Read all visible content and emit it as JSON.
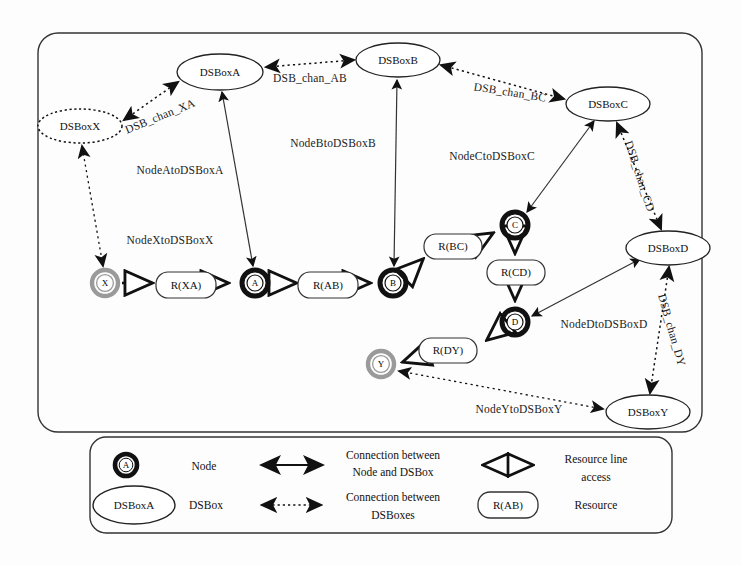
{
  "diagram": {
    "frame": {
      "name": "main-frame"
    },
    "nodes": [
      {
        "id": "X",
        "label": "X",
        "x": 105,
        "y": 283,
        "style": "gray"
      },
      {
        "id": "A",
        "label": "A",
        "x": 255,
        "y": 283,
        "style": "black"
      },
      {
        "id": "B",
        "label": "B",
        "x": 393,
        "y": 283,
        "style": "black"
      },
      {
        "id": "C",
        "label": "C",
        "x": 515,
        "y": 225,
        "style": "black"
      },
      {
        "id": "D",
        "label": "D",
        "x": 515,
        "y": 322,
        "style": "black"
      },
      {
        "id": "Y",
        "label": "Y",
        "x": 381,
        "y": 364,
        "style": "gray"
      }
    ],
    "resources": [
      {
        "id": "RXA",
        "label": "R(XA)",
        "x": 185,
        "y": 285
      },
      {
        "id": "RAB",
        "label": "R(AB)",
        "x": 328,
        "y": 285
      },
      {
        "id": "RBC",
        "label": "R(BC)",
        "x": 452,
        "y": 246
      },
      {
        "id": "RCD",
        "label": "R(CD)",
        "x": 515,
        "y": 272
      },
      {
        "id": "RDY",
        "label": "R(DY)",
        "x": 447,
        "y": 350
      }
    ],
    "dsboxes": [
      {
        "id": "DSBoxX",
        "label": "DSBoxX",
        "x": 80,
        "y": 126,
        "rx": 42,
        "ry": 17,
        "outline": "dotted"
      },
      {
        "id": "DSBoxA",
        "label": "DSBoxA",
        "x": 220,
        "y": 72,
        "rx": 43,
        "ry": 18,
        "outline": "solid"
      },
      {
        "id": "DSBoxB",
        "label": "DSBoxB",
        "x": 398,
        "y": 60,
        "rx": 42,
        "ry": 17,
        "outline": "solid"
      },
      {
        "id": "DSBoxC",
        "label": "DSBoxC",
        "x": 608,
        "y": 104,
        "rx": 42,
        "ry": 17,
        "outline": "solid"
      },
      {
        "id": "DSBoxD",
        "label": "DSBoxD",
        "x": 668,
        "y": 248,
        "rx": 42,
        "ry": 17,
        "outline": "solid"
      },
      {
        "id": "DSBoxY",
        "label": "DSBoxY",
        "x": 648,
        "y": 412,
        "rx": 42,
        "ry": 17,
        "outline": "solid"
      }
    ],
    "edge_labels": [
      {
        "id": "chan_XA",
        "text": "DSB_chan_XA",
        "x": 160,
        "y": 116,
        "rotate": -22
      },
      {
        "id": "chan_AB",
        "text": "DSB_chan_AB",
        "x": 310,
        "y": 78,
        "rotate": 0
      },
      {
        "id": "chan_BC",
        "text": "DSB_chan_BC",
        "x": 510,
        "y": 92,
        "rotate": 8
      },
      {
        "id": "chan_CD",
        "text": "DSB_chan_CD",
        "x": 640,
        "y": 176,
        "rotate": 72
      },
      {
        "id": "chan_DY",
        "text": "DSB_chan_DY",
        "x": 672,
        "y": 330,
        "rotate": 74
      },
      {
        "id": "n_A",
        "text": "NodeAtoDSBoxA",
        "x": 180,
        "y": 170,
        "rotate": 0
      },
      {
        "id": "n_X",
        "text": "NodeXtoDSBoxX",
        "x": 170,
        "y": 240,
        "rotate": 0
      },
      {
        "id": "n_B",
        "text": "NodeBtoDSBoxB",
        "x": 333,
        "y": 143,
        "rotate": 0
      },
      {
        "id": "n_C",
        "text": "NodeCtoDSBoxC",
        "x": 492,
        "y": 156,
        "rotate": 0
      },
      {
        "id": "n_D",
        "text": "NodeDtoDSBoxD",
        "x": 604,
        "y": 324,
        "rotate": 0
      },
      {
        "id": "n_Y",
        "text": "NodeYtoDSBoxY",
        "x": 519,
        "y": 409,
        "rotate": 0
      }
    ]
  },
  "legend": {
    "name": "legend-box",
    "rows": [
      {
        "symbol": "node-glyph",
        "symbol_label": "A",
        "text": "Node",
        "arrow": "solid-double-arrow",
        "desc": "Connection between\nNode and DSBox",
        "desc_line1": "Connection between",
        "desc_line2": "Node and DSBox",
        "arrow2": "hollow-double-arrow",
        "desc2_line1": "Resource line",
        "desc2_line2": "access"
      },
      {
        "symbol": "dsbox-glyph",
        "symbol_label": "DSBoxA",
        "text": "DSBox",
        "arrow": "dotted-double-arrow",
        "desc": "Connection between\nDSBoxes",
        "desc_line1": "Connection between",
        "desc_line2": "DSBoxes",
        "arrow2": "resource-glyph",
        "symbol2_label": "R(AB)",
        "desc2_line1": "Resource",
        "desc2_line2": ""
      }
    ]
  },
  "colors": {
    "ink": "#1a1a1a",
    "node_black": "#111111",
    "node_gray": "#9a9a9a",
    "background": "#fdfdfd"
  }
}
